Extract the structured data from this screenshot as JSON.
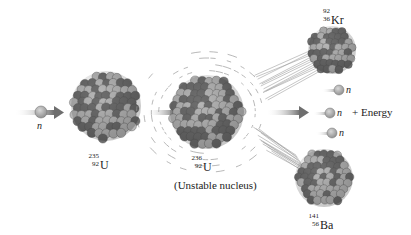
{
  "diagram": {
    "type": "nuclear-fission",
    "colors": {
      "nucleon_light": "#b8b8b8",
      "nucleon_dark": "#6e6e6e",
      "neutron": "#a9a9a9",
      "arrow": "#7a7a7a",
      "vibration_lines": "#9a9a9a",
      "text": "#222222"
    },
    "incoming_neutron": {
      "label": "n"
    },
    "reactant": {
      "mass": "235",
      "atomic": "92",
      "symbol": "U"
    },
    "intermediate": {
      "mass": "236",
      "atomic": "92",
      "symbol": "U",
      "caption": "(Unstable nucleus)"
    },
    "products": {
      "fragment_1": {
        "mass": "92",
        "atomic": "36",
        "symbol": "Kr"
      },
      "fragment_2": {
        "mass": "141",
        "atomic": "56",
        "symbol": "Ba"
      },
      "neutrons": [
        {
          "label": "n"
        },
        {
          "label": "n"
        },
        {
          "label": "n"
        }
      ],
      "energy_label": "+ Energy"
    }
  }
}
